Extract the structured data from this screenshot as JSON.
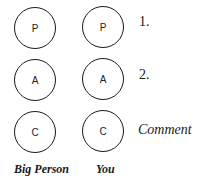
{
  "rows": [
    {
      "big_person": "P",
      "you": "P",
      "label": "1."
    },
    {
      "big_person": "A",
      "you": "A",
      "label": "2."
    },
    {
      "big_person": "C",
      "you": "C",
      "label": "Comment"
    }
  ],
  "columns": {
    "big_person": "Big Person",
    "you": "You"
  },
  "colors": {
    "stroke": "#1a1a1a",
    "background": "#ffffff"
  }
}
